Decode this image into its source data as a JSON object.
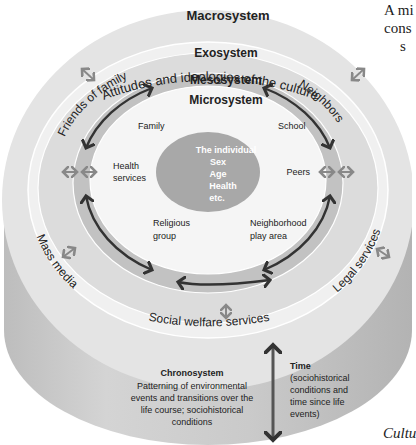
{
  "diagram": {
    "type": "bronfenbrenner-ecological-model",
    "colors": {
      "macro": "#e6e6e6",
      "exo": "#f2f2f2",
      "meso": "#c4c4c4",
      "micro": "#f6f6f6",
      "individual": "#a9a9a9",
      "cylinder_side": "#c8c8c8",
      "arrow_dark": "#3a3a3a",
      "arrow_light": "#8a8a8a"
    },
    "macrosystem": {
      "title": "Macrosystem",
      "subtitle": "Attitudes and ideologies of the culture"
    },
    "exosystem": {
      "title": "Exosystem",
      "items": [
        "Friends of family",
        "Neighbors",
        "Mass media",
        "Legal services",
        "Social welfare services"
      ]
    },
    "mesosystem": {
      "title": "Mesosystem"
    },
    "microsystem": {
      "title": "Microsystem",
      "items": [
        "Family",
        "School",
        "Health services",
        "Peers",
        "Religious group",
        "Neighborhood play area"
      ]
    },
    "individual": {
      "lines": [
        "The individual",
        "Sex",
        "Age",
        "Health",
        "etc."
      ]
    },
    "chronosystem": {
      "title": "Chronosystem",
      "lines": [
        "Patterning of environmental",
        "events and transitions over the",
        "life course; sociohistorical",
        "conditions"
      ]
    },
    "time": {
      "title": "Time",
      "lines": [
        "(sociohistorical",
        "conditions and",
        "time since life",
        "events)"
      ]
    }
  },
  "margin_text": {
    "top_right": [
      "A mi",
      "cons",
      "s"
    ],
    "bottom_right": "Cultu"
  }
}
